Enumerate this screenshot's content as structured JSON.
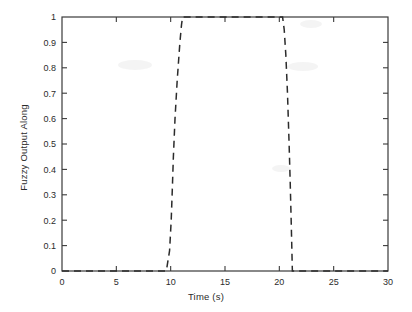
{
  "chart_data": {
    "type": "line",
    "title": "",
    "xlabel": "Time (s)",
    "ylabel": "Fuzzy Output Along",
    "xlim": [
      0,
      30
    ],
    "ylim": [
      0,
      1
    ],
    "grid": false,
    "legend": null,
    "xticks": [
      "0",
      "5",
      "10",
      "15",
      "20",
      "25",
      "30"
    ],
    "xtick_values": [
      0,
      5,
      10,
      15,
      20,
      25,
      30
    ],
    "yticks": [
      "0",
      "0.1",
      "0.2",
      "0.3",
      "0.4",
      "0.5",
      "0.6",
      "0.7",
      "0.8",
      "0.9",
      "1"
    ],
    "ytick_values": [
      0,
      0.1,
      0.2,
      0.3,
      0.4,
      0.5,
      0.6,
      0.7,
      0.8,
      0.9,
      1
    ],
    "line_style": "dashed",
    "line_color": "#2b2b2b",
    "series": [
      {
        "name": "Fuzzy Output Along",
        "x": [
          0,
          5,
          9.6,
          9.9,
          10.05,
          10.15,
          10.25,
          10.4,
          10.6,
          10.85,
          11.0,
          11.1,
          15,
          20.3,
          20.45,
          20.6,
          20.75,
          20.9,
          21.0,
          21.1,
          21.2,
          25,
          30
        ],
        "y": [
          0,
          0,
          0,
          0.08,
          0.2,
          0.32,
          0.45,
          0.6,
          0.75,
          0.9,
          0.97,
          1.0,
          1.0,
          1.0,
          0.95,
          0.85,
          0.7,
          0.5,
          0.35,
          0.18,
          0,
          0,
          0
        ]
      }
    ]
  },
  "axes": {
    "x_axis_label": "Time (s)",
    "y_axis_label": "Fuzzy Output Along"
  }
}
